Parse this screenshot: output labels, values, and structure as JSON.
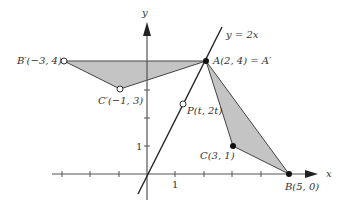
{
  "diagram": {
    "type": "coordinate-plane-reflection",
    "axes": {
      "x_label": "x",
      "y_label": "y",
      "x_tick_label": "1",
      "y_tick_label": "1",
      "origin_px": [
        147,
        174
      ],
      "unit_x_px": 28.4,
      "unit_y_px": 28
    },
    "line": {
      "label": "y = 2x",
      "equation": "y = 2x"
    },
    "points": {
      "A": {
        "label": "A(2, 4) = A′",
        "coords": [
          2,
          4
        ],
        "style": "filled"
      },
      "B": {
        "label": "B(5, 0)",
        "coords": [
          5,
          0
        ],
        "style": "filled"
      },
      "C": {
        "label": "C(3, 1)",
        "coords": [
          3,
          1
        ],
        "style": "filled"
      },
      "B_prime": {
        "label": "B′(−3, 4)",
        "coords": [
          -3,
          4
        ],
        "style": "open"
      },
      "C_prime": {
        "label": "C′(−1, 3)",
        "coords": [
          -1,
          3
        ],
        "style": "open"
      },
      "P": {
        "label": "P(t, 2t)",
        "coords": [
          1.25,
          2.5
        ],
        "style": "open"
      }
    },
    "triangles": [
      {
        "name": "ABC",
        "vertices": [
          "A",
          "B",
          "C"
        ],
        "fill": "#c0c0c0"
      },
      {
        "name": "A'B'C'",
        "vertices": [
          "A",
          "B_prime",
          "C_prime"
        ],
        "fill": "#c0c0c0"
      }
    ],
    "colors": {
      "axis": "#555555",
      "line": "#222222",
      "shade": "#c4c4c4",
      "stroke": "#444444"
    }
  }
}
